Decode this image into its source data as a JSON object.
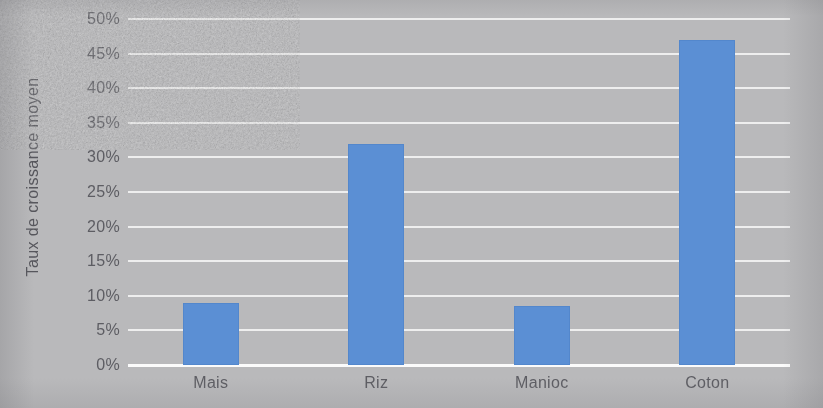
{
  "chart_data": {
    "type": "bar",
    "title": "",
    "xlabel": "",
    "ylabel": "Taux de croissance moyen",
    "categories": [
      "Mais",
      "Riz",
      "Manioc",
      "Coton"
    ],
    "values": [
      9,
      32,
      8.5,
      47
    ],
    "ylim": [
      0,
      50
    ],
    "ytick_values": [
      0,
      5,
      10,
      15,
      20,
      25,
      30,
      35,
      40,
      45,
      50
    ],
    "ytick_labels": [
      "0%",
      "5%",
      "10%",
      "15%",
      "20%",
      "25%",
      "30%",
      "35%",
      "40%",
      "45%",
      "50%"
    ],
    "grid": true,
    "legend": false,
    "series": [
      {
        "name": "Taux de croissance moyen",
        "values": [
          9,
          32,
          8.5,
          47
        ],
        "color": "#5b8fd4"
      }
    ],
    "colors": {
      "bar": "#5b8fd4",
      "gridline": "#f2f2f2",
      "axis_line": "#fbfbfb",
      "plot_background": "#b9b9bb",
      "tick_label": "#5d5d63",
      "axis_title": "#56565c"
    }
  }
}
